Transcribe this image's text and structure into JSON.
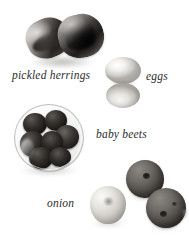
{
  "figure": {
    "kind": "ingredient-photograph",
    "palette": "grayscale",
    "background_color": "#ffffff",
    "label_color": "#2b2b2b",
    "label_style": "italic-serif"
  },
  "labels": {
    "herrings": "pickled herrings",
    "eggs": "eggs",
    "baby_beets": "baby beets",
    "onion": "onion"
  },
  "items": [
    {
      "name": "pickled-herrings",
      "label": "pickled herrings",
      "count": 2,
      "tone": "dark",
      "description": "two rolled herring fillets"
    },
    {
      "name": "eggs",
      "label": "eggs",
      "count": 2,
      "tone": "light",
      "description": "two pale egg halves stacked"
    },
    {
      "name": "baby-beets",
      "label": "baby beets",
      "count": 7,
      "tone": "dark",
      "description": "glass bowl filled with small dark beets"
    },
    {
      "name": "onion",
      "label": "onion",
      "count": 1,
      "tone": "light",
      "description": "single pale onion"
    },
    {
      "name": "loose-beets",
      "label": "baby beets",
      "count": 2,
      "tone": "mid-dark",
      "description": "two loose beets with stem marks"
    }
  ]
}
